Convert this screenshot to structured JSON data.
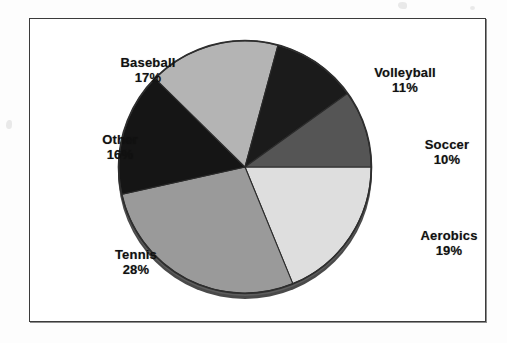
{
  "chart_data": {
    "type": "pie",
    "title": "",
    "subtitle": "",
    "xlabel": "",
    "ylabel": "",
    "legend_position": "none",
    "grid": false,
    "label_format": "name + percent",
    "categories": [
      "Aerobics",
      "Tennis",
      "Other",
      "Baseball",
      "Volleyball",
      "Soccer"
    ],
    "values": [
      19,
      28,
      16,
      17,
      11,
      10
    ],
    "unit": "%",
    "total": 101,
    "start_angle_deg": 0,
    "direction": "clockwise",
    "slices": [
      {
        "name": "Aerobics",
        "percent": 19,
        "label": "Aerobics",
        "percent_text": "19%",
        "color": "#dedede"
      },
      {
        "name": "Tennis",
        "percent": 28,
        "label": "Tennis",
        "percent_text": "28%",
        "color": "#9a9a9a"
      },
      {
        "name": "Other",
        "percent": 16,
        "label": "Other",
        "percent_text": "16%",
        "color": "#151515"
      },
      {
        "name": "Baseball",
        "percent": 17,
        "label": "Baseball",
        "percent_text": "17%",
        "color": "#b4b4b4"
      },
      {
        "name": "Volleyball",
        "percent": 11,
        "label": "Volleyball",
        "percent_text": "11%",
        "color": "#1b1b1b"
      },
      {
        "name": "Soccer",
        "percent": 10,
        "label": "Soccer",
        "percent_text": "10%",
        "color": "#555555"
      }
    ]
  },
  "frame": {
    "border_color": "#3b3b3b",
    "background": "#ffffff"
  }
}
